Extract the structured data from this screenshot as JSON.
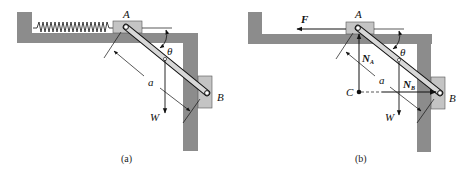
{
  "figure": {
    "panels": [
      {
        "id": "a",
        "caption": "(a)",
        "labels": {
          "point_a": "A",
          "point_b": "B",
          "angle": "θ",
          "length": "a",
          "weight": "W"
        }
      },
      {
        "id": "b",
        "caption": "(b)",
        "labels": {
          "point_a": "A",
          "point_b": "B",
          "point_c": "C",
          "angle": "θ",
          "length": "a",
          "weight": "W",
          "force": "F",
          "normal_a": "N",
          "normal_a_sub": "A",
          "normal_b": "N",
          "normal_b_sub": "B"
        }
      }
    ],
    "colors": {
      "wall": "#8c8c8c",
      "slider": "#c4c4c4",
      "line": "#111111"
    }
  }
}
